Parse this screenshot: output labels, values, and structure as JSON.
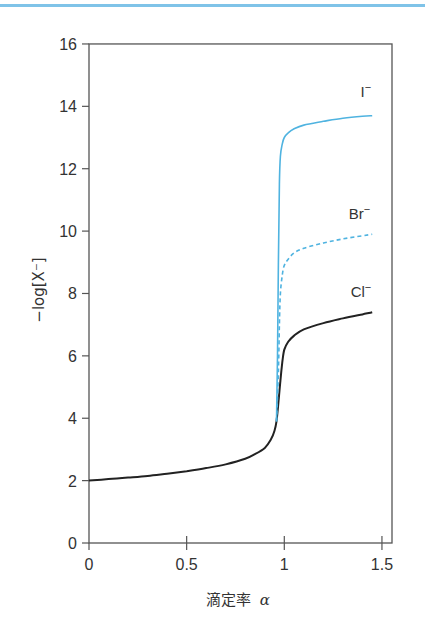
{
  "chart_data": {
    "type": "line",
    "title": "",
    "xlabel": "滴定率 α",
    "xlabel_text": "滴定率",
    "xlabel_symbol": "α",
    "ylabel": "−log[X⁻]",
    "xlim": [
      0,
      1.55
    ],
    "ylim": [
      0,
      16
    ],
    "x_ticks": [
      0,
      0.5,
      1,
      1.5
    ],
    "x_tick_labels": [
      "0",
      "0.5",
      "1",
      "1.5"
    ],
    "y_ticks": [
      0,
      2,
      4,
      6,
      8,
      10,
      12,
      14,
      16
    ],
    "y_tick_labels": [
      "0",
      "2",
      "4",
      "6",
      "8",
      "10",
      "12",
      "14",
      "16"
    ],
    "grid": false,
    "legend": "inline labels at curve ends",
    "series": [
      {
        "name": "Cl⁻",
        "color": "#222222",
        "style": "solid",
        "x": [
          0,
          0.1,
          0.2,
          0.3,
          0.4,
          0.5,
          0.6,
          0.7,
          0.8,
          0.85,
          0.9,
          0.93,
          0.95,
          0.96,
          0.97,
          0.98,
          0.99,
          1.0,
          1.02,
          1.05,
          1.1,
          1.2,
          1.3,
          1.4,
          1.45
        ],
        "values": [
          2.0,
          2.05,
          2.1,
          2.15,
          2.22,
          2.3,
          2.4,
          2.52,
          2.7,
          2.85,
          3.05,
          3.3,
          3.6,
          3.9,
          4.5,
          5.2,
          5.8,
          6.2,
          6.45,
          6.65,
          6.85,
          7.05,
          7.2,
          7.33,
          7.4
        ]
      },
      {
        "name": "Br⁻",
        "color": "#4fb3e0",
        "style": "dashed",
        "x": [
          0.96,
          0.97,
          0.975,
          0.98,
          0.99,
          1.0,
          1.02,
          1.05,
          1.1,
          1.2,
          1.3,
          1.4,
          1.45
        ],
        "values": [
          3.9,
          5.5,
          7.0,
          8.0,
          8.6,
          8.9,
          9.1,
          9.3,
          9.45,
          9.62,
          9.75,
          9.85,
          9.9
        ]
      },
      {
        "name": "I⁻",
        "color": "#4fb3e0",
        "style": "solid",
        "x": [
          0.96,
          0.965,
          0.97,
          0.975,
          0.98,
          0.99,
          1.0,
          1.02,
          1.05,
          1.1,
          1.2,
          1.3,
          1.4,
          1.45
        ],
        "values": [
          3.9,
          6.0,
          9.0,
          11.5,
          12.4,
          12.8,
          13.0,
          13.15,
          13.28,
          13.4,
          13.52,
          13.62,
          13.68,
          13.7
        ]
      }
    ],
    "series_labels": [
      {
        "text": "I",
        "sup": "−",
        "x": 1.39,
        "y": 14.3
      },
      {
        "text": "Br",
        "sup": "−",
        "x": 1.33,
        "y": 10.4
      },
      {
        "text": "Cl",
        "sup": "−",
        "x": 1.34,
        "y": 7.9
      }
    ]
  },
  "decoration": {
    "top_rule_color": "#7fc3e8",
    "axis_color": "#555555"
  }
}
